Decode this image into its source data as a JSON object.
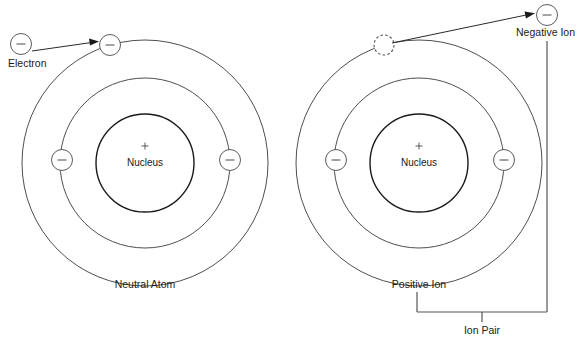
{
  "figure": {
    "background_color": "#ffffff",
    "line_color": "#3a3a3a",
    "text_color": "#1a1a1a"
  },
  "labels": {
    "electron": "Electron",
    "nucleus_left": "Nucleus",
    "nucleus_right": "Nucleus",
    "neutral_atom": "Neutral Atom",
    "positive_ion": "Positive Ion",
    "negative_ion": "Negative Ion",
    "ion_pair": "Ion Pair",
    "nucleus_charge_left": "+",
    "nucleus_charge_right": "+"
  },
  "atoms": [
    {
      "id": "neutral-atom",
      "caption": "Neutral Atom",
      "center": {
        "x": 145,
        "y": 163
      },
      "shells": [
        {
          "name": "nucleus",
          "radius": 49
        },
        {
          "name": "inner-shell",
          "radius": 85
        },
        {
          "name": "outer-shell",
          "radius": 123
        }
      ],
      "electrons": [
        {
          "name": "outer-shell-electron",
          "x": 110,
          "y": 45,
          "r": 10.5,
          "state": "present"
        },
        {
          "name": "inner-shell-electron-left",
          "x": 62,
          "y": 160,
          "r": 10.5,
          "state": "present"
        },
        {
          "name": "inner-shell-electron-right",
          "x": 230,
          "y": 160,
          "r": 10.5,
          "state": "present"
        }
      ]
    },
    {
      "id": "positive-ion",
      "caption": "Positive Ion",
      "center": {
        "x": 419,
        "y": 163
      },
      "shells": [
        {
          "name": "nucleus",
          "radius": 49
        },
        {
          "name": "inner-shell",
          "radius": 85
        },
        {
          "name": "outer-shell",
          "radius": 123
        }
      ],
      "electrons": [
        {
          "name": "outer-shell-vacancy",
          "x": 384,
          "y": 45,
          "r": 10.5,
          "state": "vacant"
        },
        {
          "name": "inner-shell-electron-left",
          "x": 336,
          "y": 160,
          "r": 10.5,
          "state": "present"
        },
        {
          "name": "inner-shell-electron-right",
          "x": 504,
          "y": 160,
          "r": 10.5,
          "state": "present"
        }
      ]
    }
  ],
  "free_electrons": [
    {
      "name": "free-electron-left",
      "x": 21,
      "y": 44,
      "r": 10.5,
      "label": "Electron"
    },
    {
      "name": "negative-ion-electron",
      "x": 547,
      "y": 15,
      "r": 10.5,
      "label": "Negative Ion"
    }
  ],
  "arrows": [
    {
      "name": "electron-capture-arrow",
      "from": {
        "x": 32,
        "y": 51
      },
      "to": {
        "x": 98,
        "y": 42
      }
    },
    {
      "name": "electron-ejection-arrow",
      "from": {
        "x": 391,
        "y": 43
      },
      "to": {
        "x": 534,
        "y": 14
      }
    }
  ],
  "brackets": {
    "ion_pair": {
      "name": "ion-pair-bracket",
      "left_x": 417,
      "right_x": 547,
      "top_left_y": 292,
      "top_right_y": 28,
      "bar_y": 312,
      "stem_x": 482,
      "stem_bottom_y": 322,
      "label": "Ion Pair"
    }
  }
}
